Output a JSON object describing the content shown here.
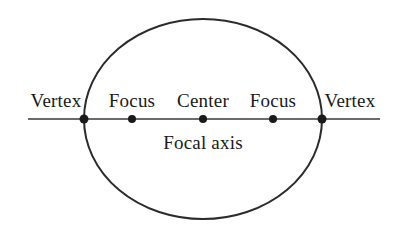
{
  "figure": {
    "background_color": "#ffffff",
    "width": 404,
    "height": 229
  },
  "chart_data": {
    "type": "diagram",
    "shape": "ellipse",
    "title": "",
    "ellipse": {
      "center_x": 203,
      "center_y": 119,
      "semi_major_axis_rx": 119,
      "semi_minor_axis_ry": 100,
      "stroke_color": "#2b2b2b",
      "stroke_width": 2,
      "fill": "none"
    },
    "focal_axis_line": {
      "x_start": 28,
      "x_end": 380,
      "y": 119,
      "stroke_color": "#3a3a3a",
      "stroke_width": 1.4
    },
    "points": [
      {
        "name": "left-vertex",
        "label": "Vertex",
        "x": 84,
        "y": 119,
        "radius": 4.5,
        "color": "#1a1a1a"
      },
      {
        "name": "left-focus",
        "label": "Focus",
        "x": 132,
        "y": 119,
        "radius": 4.0,
        "color": "#1a1a1a"
      },
      {
        "name": "center",
        "label": "Center",
        "x": 203,
        "y": 119,
        "radius": 4.0,
        "color": "#1a1a1a"
      },
      {
        "name": "right-focus",
        "label": "Focus",
        "x": 273,
        "y": 119,
        "radius": 4.0,
        "color": "#1a1a1a"
      },
      {
        "name": "right-vertex",
        "label": "Vertex",
        "x": 322,
        "y": 119,
        "radius": 4.5,
        "color": "#1a1a1a"
      }
    ],
    "axis_caption": "Focal axis"
  },
  "labels": {
    "left_vertex": "Vertex",
    "left_focus": "Focus",
    "center": "Center",
    "right_focus": "Focus",
    "right_vertex": "Vertex",
    "focal_axis": "Focal axis"
  },
  "colors": {
    "stroke": "#2b2b2b",
    "axis": "#3a3a3a",
    "point": "#1a1a1a",
    "text": "#1a1a1a",
    "background": "#ffffff"
  }
}
